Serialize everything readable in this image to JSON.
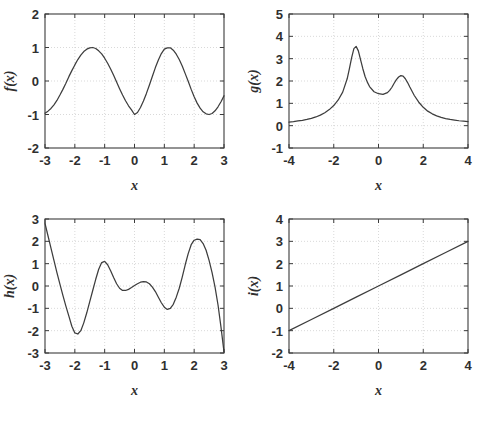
{
  "figure": {
    "title": "",
    "background_color": "#ffffff",
    "line_color": "#3d3d3d",
    "grid_color": "#c9c9c9",
    "axis_color": "#3b3b3b",
    "layout": "2x2 grid of line plots"
  },
  "chart_data": [
    {
      "type": "line",
      "name": "panel-f",
      "title": "",
      "xlabel": "x",
      "ylabel": "f(x)",
      "xlim": [
        -3,
        3
      ],
      "ylim": [
        -2,
        2
      ],
      "xticks": [
        "-3",
        "-2",
        "-1",
        "0",
        "1",
        "2",
        "3"
      ],
      "yticks": [
        "-2",
        "-1",
        "0",
        "1",
        "2"
      ],
      "xtick_values": [
        -3,
        -2,
        -1,
        0,
        1,
        2,
        3
      ],
      "ytick_values": [
        -2,
        -1,
        0,
        1,
        2
      ],
      "grid": true,
      "legend": "none",
      "annotations": [],
      "series": [
        {
          "name": "f(x)",
          "x": [
            -3.0,
            -2.9,
            -2.8,
            -2.7,
            -2.6,
            -2.5,
            -2.4,
            -2.3,
            -2.2,
            -2.1,
            -2.0,
            -1.9,
            -1.8,
            -1.7,
            -1.6,
            -1.5,
            -1.4,
            -1.3,
            -1.2,
            -1.1,
            -1.0,
            -0.9,
            -0.8,
            -0.7,
            -0.6,
            -0.5,
            -0.4,
            -0.3,
            -0.2,
            -0.1,
            0.0,
            0.1,
            0.2,
            0.3,
            0.4,
            0.5,
            0.6,
            0.7,
            0.8,
            0.9,
            1.0,
            1.1,
            1.2,
            1.3,
            1.4,
            1.5,
            1.6,
            1.7,
            1.8,
            1.9,
            2.0,
            2.1,
            2.2,
            2.3,
            2.4,
            2.5,
            2.6,
            2.7,
            2.8,
            2.9,
            3.0
          ],
          "y": [
            -0.96,
            -0.9,
            -0.82,
            -0.71,
            -0.58,
            -0.42,
            -0.25,
            -0.07,
            0.13,
            0.31,
            0.48,
            0.64,
            0.77,
            0.88,
            0.95,
            0.99,
            1.0,
            0.97,
            0.9,
            0.81,
            0.68,
            0.53,
            0.36,
            0.17,
            -0.03,
            -0.23,
            -0.42,
            -0.59,
            -0.74,
            -0.86,
            -1.0,
            -0.94,
            -0.79,
            -0.6,
            -0.37,
            -0.12,
            0.14,
            0.4,
            0.63,
            0.82,
            0.95,
            0.99,
            0.99,
            0.92,
            0.8,
            0.64,
            0.45,
            0.22,
            -0.01,
            -0.25,
            -0.47,
            -0.66,
            -0.81,
            -0.92,
            -0.98,
            -1.0,
            -0.97,
            -0.89,
            -0.77,
            -0.62,
            -0.44
          ]
        }
      ]
    },
    {
      "type": "line",
      "name": "panel-g",
      "title": "",
      "xlabel": "x",
      "ylabel": "g(x)",
      "xlim": [
        -4,
        4
      ],
      "ylim": [
        -1,
        5
      ],
      "xticks": [
        "-4",
        "-2",
        "0",
        "2",
        "4"
      ],
      "yticks": [
        "-1",
        "0",
        "1",
        "2",
        "3",
        "4",
        "5"
      ],
      "xtick_values": [
        -4,
        -2,
        0,
        2,
        4
      ],
      "ytick_values": [
        -1,
        0,
        1,
        2,
        3,
        4,
        5
      ],
      "grid": true,
      "legend": "none",
      "annotations": [],
      "series": [
        {
          "name": "g(x)",
          "x": [
            -4.0,
            -3.8,
            -3.6,
            -3.4,
            -3.2,
            -3.0,
            -2.8,
            -2.6,
            -2.4,
            -2.2,
            -2.0,
            -1.8,
            -1.6,
            -1.4,
            -1.3,
            -1.2,
            -1.1,
            -1.0,
            -0.9,
            -0.8,
            -0.7,
            -0.6,
            -0.5,
            -0.4,
            -0.2,
            0.0,
            0.2,
            0.4,
            0.5,
            0.6,
            0.7,
            0.8,
            0.9,
            1.0,
            1.1,
            1.2,
            1.3,
            1.4,
            1.6,
            1.8,
            2.0,
            2.2,
            2.4,
            2.6,
            2.8,
            3.0,
            3.2,
            3.4,
            3.6,
            3.8,
            4.0
          ],
          "y": [
            0.16,
            0.18,
            0.21,
            0.24,
            0.28,
            0.33,
            0.39,
            0.47,
            0.58,
            0.72,
            0.9,
            1.15,
            1.5,
            2.1,
            2.55,
            3.05,
            3.45,
            3.55,
            3.35,
            2.95,
            2.55,
            2.2,
            1.95,
            1.75,
            1.52,
            1.43,
            1.4,
            1.48,
            1.58,
            1.72,
            1.9,
            2.06,
            2.18,
            2.24,
            2.22,
            2.1,
            1.93,
            1.73,
            1.35,
            1.05,
            0.82,
            0.65,
            0.53,
            0.44,
            0.37,
            0.32,
            0.28,
            0.25,
            0.22,
            0.2,
            0.18
          ]
        }
      ]
    },
    {
      "type": "line",
      "name": "panel-h",
      "title": "",
      "xlabel": "x",
      "ylabel": "h(x)",
      "xlim": [
        -3,
        3
      ],
      "ylim": [
        -3,
        3
      ],
      "xticks": [
        "-3",
        "-2",
        "-1",
        "0",
        "1",
        "2",
        "3"
      ],
      "yticks": [
        "-3",
        "-2",
        "-1",
        "0",
        "1",
        "2",
        "3"
      ],
      "xtick_values": [
        -3,
        -2,
        -1,
        0,
        1,
        2,
        3
      ],
      "ytick_values": [
        -3,
        -2,
        -1,
        0,
        1,
        2,
        3
      ],
      "grid": true,
      "legend": "none",
      "annotations": [],
      "series": [
        {
          "name": "h(x)",
          "x": [
            -3.0,
            -2.9,
            -2.8,
            -2.7,
            -2.6,
            -2.5,
            -2.4,
            -2.3,
            -2.2,
            -2.1,
            -2.0,
            -1.9,
            -1.8,
            -1.7,
            -1.6,
            -1.5,
            -1.4,
            -1.3,
            -1.2,
            -1.1,
            -1.0,
            -0.9,
            -0.8,
            -0.7,
            -0.6,
            -0.5,
            -0.4,
            -0.3,
            -0.2,
            -0.1,
            0.0,
            0.1,
            0.2,
            0.3,
            0.4,
            0.5,
            0.6,
            0.7,
            0.8,
            0.9,
            1.0,
            1.1,
            1.2,
            1.3,
            1.4,
            1.5,
            1.6,
            1.7,
            1.8,
            1.9,
            2.0,
            2.1,
            2.2,
            2.3,
            2.4,
            2.5,
            2.6,
            2.7,
            2.8,
            2.9,
            3.0
          ],
          "y": [
            2.8,
            2.25,
            1.7,
            1.15,
            0.6,
            0.08,
            -0.42,
            -0.9,
            -1.35,
            -1.8,
            -2.1,
            -2.15,
            -2.0,
            -1.65,
            -1.2,
            -0.7,
            -0.2,
            0.3,
            0.75,
            1.05,
            1.1,
            0.95,
            0.68,
            0.38,
            0.1,
            -0.1,
            -0.2,
            -0.2,
            -0.15,
            -0.07,
            0.02,
            0.1,
            0.17,
            0.2,
            0.18,
            0.1,
            -0.05,
            -0.25,
            -0.5,
            -0.75,
            -0.95,
            -1.05,
            -1.0,
            -0.82,
            -0.5,
            -0.1,
            0.4,
            0.95,
            1.45,
            1.85,
            2.05,
            2.1,
            2.08,
            1.9,
            1.6,
            1.15,
            0.6,
            -0.05,
            -0.85,
            -1.85,
            -2.95
          ]
        }
      ]
    },
    {
      "type": "line",
      "name": "panel-i",
      "title": "",
      "xlabel": "x",
      "ylabel": "i(x)",
      "xlim": [
        -4,
        4
      ],
      "ylim": [
        -2,
        4
      ],
      "xticks": [
        "-4",
        "-2",
        "0",
        "2",
        "4"
      ],
      "yticks": [
        "-2",
        "-1",
        "0",
        "1",
        "2",
        "3",
        "4"
      ],
      "xtick_values": [
        -4,
        -2,
        0,
        2,
        4
      ],
      "ytick_values": [
        -2,
        -1,
        0,
        1,
        2,
        3,
        4
      ],
      "grid": true,
      "legend": "none",
      "annotations": [],
      "series": [
        {
          "name": "i(x)",
          "x": [
            -4,
            -3,
            -2,
            -1,
            0,
            1,
            2,
            3,
            4
          ],
          "y": [
            -1,
            -0.5,
            0,
            0.5,
            1,
            1.5,
            2,
            2.5,
            3
          ]
        }
      ]
    }
  ]
}
